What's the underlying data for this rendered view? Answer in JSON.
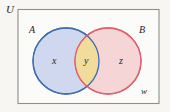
{
  "figure": {
    "type": "venn-diagram",
    "background_color": "#f7f6f3",
    "universe": {
      "label": "U",
      "border_color": "#8e8e8e",
      "fill_color": "#fbfbf9"
    },
    "sets": [
      {
        "id": "A",
        "label": "A",
        "stroke_color": "#3f6fb0",
        "fill_color": "#ccd6ee",
        "center_x": 66,
        "center_y": 61,
        "radius": 33
      },
      {
        "id": "B",
        "label": "B",
        "stroke_color": "#e0606e",
        "fill_color": "#f6d3d4",
        "center_x": 108,
        "center_y": 61,
        "radius": 33
      }
    ],
    "regions": [
      {
        "id": "x",
        "label": "x",
        "description": "A only",
        "fill_color": "#ccd6ee"
      },
      {
        "id": "y",
        "label": "y",
        "description": "A intersect B",
        "fill_color": "#f2dc9a"
      },
      {
        "id": "z",
        "label": "z",
        "description": "B only",
        "fill_color": "#f6d3d4"
      },
      {
        "id": "w",
        "label": "w",
        "description": "outside A and B",
        "fill_color": "#fbfbf9"
      }
    ]
  }
}
